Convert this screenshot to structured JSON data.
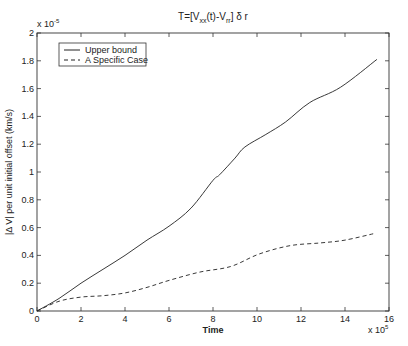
{
  "chart_data": {
    "type": "line",
    "title_parts": {
      "prefix": "T=[V",
      "sub1": "xx",
      "mid": "(t)-V",
      "sub2": "rr",
      "suffix": "] δ r"
    },
    "xlabel": "Time",
    "ylabel": "|Δ V| per unit initial offset (km/s)",
    "x_multiplier": {
      "base": "x 10",
      "exp": "5"
    },
    "y_multiplier": {
      "base": "x 10",
      "exp": "-5"
    },
    "xlim": [
      0,
      16
    ],
    "ylim": [
      0,
      2
    ],
    "xticks": [
      0,
      2,
      4,
      6,
      8,
      10,
      12,
      14,
      16
    ],
    "xtick_labels": [
      "0",
      "2",
      "4",
      "6",
      "8",
      "10",
      "12",
      "14",
      "16"
    ],
    "yticks": [
      0,
      0.2,
      0.4,
      0.6,
      0.8,
      1,
      1.2,
      1.4,
      1.6,
      1.8,
      2
    ],
    "ytick_labels": [
      "0",
      "0.2",
      "0.4",
      "0.6",
      "0.8",
      "1",
      "1.2",
      "1.4",
      "1.6",
      "1.8",
      "2"
    ],
    "grid": false,
    "legend_position": "top-left",
    "series": [
      {
        "name": "Upper bound",
        "style": "solid",
        "x": [
          0,
          1,
          2,
          3,
          4,
          5,
          6,
          7,
          8,
          8.3,
          9,
          9.45,
          10.4,
          11.3,
          12.4,
          13.8,
          15.45
        ],
        "y": [
          0,
          0.09,
          0.2,
          0.3,
          0.4,
          0.51,
          0.61,
          0.74,
          0.94,
          0.98,
          1.1,
          1.18,
          1.27,
          1.36,
          1.5,
          1.61,
          1.81
        ]
      },
      {
        "name": "A Specific Case",
        "style": "dashed",
        "x": [
          0,
          1,
          2,
          3,
          4,
          5,
          6,
          7.4,
          8.8,
          10.1,
          11.5,
          12.9,
          14,
          15.4
        ],
        "y": [
          0,
          0.07,
          0.1,
          0.11,
          0.13,
          0.17,
          0.22,
          0.28,
          0.32,
          0.41,
          0.47,
          0.49,
          0.51,
          0.56
        ]
      }
    ]
  }
}
